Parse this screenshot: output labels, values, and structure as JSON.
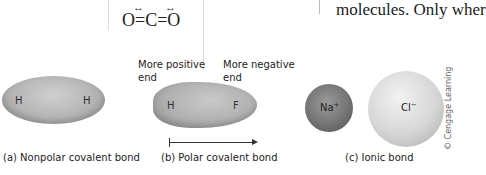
{
  "formula": {
    "text": "O=C=O",
    "dipole_arrows": [
      "↔",
      "↔"
    ]
  },
  "body_text": "molecules. Only wher",
  "panels": {
    "nonpolar": {
      "atoms": [
        "H",
        "H"
      ],
      "caption": "(a) Nonpolar covalent bond"
    },
    "polar": {
      "positive_label_line1": "More positive",
      "positive_label_line2": "end",
      "negative_label_line1": "More negative",
      "negative_label_line2": "end",
      "atoms": [
        "H",
        "F"
      ],
      "caption": "(b) Polar covalent bond"
    },
    "ionic": {
      "cation": "Na",
      "cation_charge": "+",
      "anion": "Cl",
      "anion_charge": "−",
      "caption": "(c) Ionic bond"
    }
  },
  "credit": "© Cengage Learning",
  "colors": {
    "nonpolar_fill": "#b5b5b5",
    "polar_fill": "#b0b0b0",
    "na_fill": "#747474",
    "cl_fill": "#d6d6d6"
  }
}
